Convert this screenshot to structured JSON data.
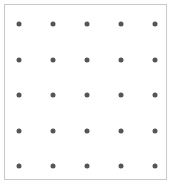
{
  "panel": {
    "name": "dot-grid-panel",
    "width": 172,
    "height": 184,
    "background_color": "#ffffff",
    "border_color": "#c9c9c9",
    "border_width": 1,
    "frame_left": 4,
    "frame_top": 4,
    "frame_width": 163,
    "frame_height": 176
  },
  "chart_data": {
    "type": "scatter",
    "title": "",
    "subtitle": "",
    "xlabel": "",
    "ylabel": "",
    "grid": false,
    "legend": null,
    "legend_position": "none",
    "axis_visible": false,
    "tick_labels_x": [],
    "tick_labels_y": [],
    "xlim": [
      0,
      172
    ],
    "ylim": [
      0,
      184
    ],
    "marker": {
      "shape": "circle",
      "diameter_px": 5,
      "color": "#555555"
    },
    "rows": 5,
    "columns": 5,
    "column_x": [
      19,
      53,
      87,
      121,
      155
    ],
    "row_y": [
      24,
      60,
      95,
      131,
      166
    ],
    "points": [
      {
        "x": 19,
        "y": 24
      },
      {
        "x": 53,
        "y": 24
      },
      {
        "x": 87,
        "y": 24
      },
      {
        "x": 121,
        "y": 24
      },
      {
        "x": 155,
        "y": 24
      },
      {
        "x": 19,
        "y": 60
      },
      {
        "x": 53,
        "y": 60
      },
      {
        "x": 87,
        "y": 60
      },
      {
        "x": 121,
        "y": 60
      },
      {
        "x": 155,
        "y": 60
      },
      {
        "x": 19,
        "y": 95
      },
      {
        "x": 53,
        "y": 95
      },
      {
        "x": 87,
        "y": 95
      },
      {
        "x": 121,
        "y": 95
      },
      {
        "x": 155,
        "y": 95
      },
      {
        "x": 19,
        "y": 131
      },
      {
        "x": 53,
        "y": 131
      },
      {
        "x": 87,
        "y": 131
      },
      {
        "x": 121,
        "y": 131
      },
      {
        "x": 155,
        "y": 131
      },
      {
        "x": 19,
        "y": 166
      },
      {
        "x": 53,
        "y": 166
      },
      {
        "x": 87,
        "y": 166
      },
      {
        "x": 121,
        "y": 166
      },
      {
        "x": 155,
        "y": 166
      }
    ]
  }
}
